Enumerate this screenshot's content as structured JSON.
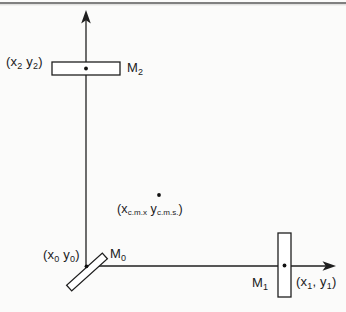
{
  "figure_type": "physics-diagram",
  "colors": {
    "background": "#fbfbfa",
    "line": "#1f1f1f",
    "shape_fill": "#ffffff",
    "top_rule": "#808080",
    "text": "#1a1a1a"
  },
  "labels": {
    "mirror2_coords": [
      "(x",
      "2",
      " y",
      "2",
      ")"
    ],
    "mirror2_name": [
      "M",
      "2"
    ],
    "center_of_mass_coords": [
      "(x",
      "c.m.x",
      " y",
      "c.m.s.",
      ")"
    ],
    "origin_coords": [
      "(x",
      "0",
      " y",
      "0",
      ")"
    ],
    "beamsplitter_name": [
      "M",
      "0"
    ],
    "mirror1_name": [
      "M",
      "1"
    ],
    "mirror1_coords": [
      "(x",
      "1",
      ", y",
      "1",
      ")"
    ]
  }
}
